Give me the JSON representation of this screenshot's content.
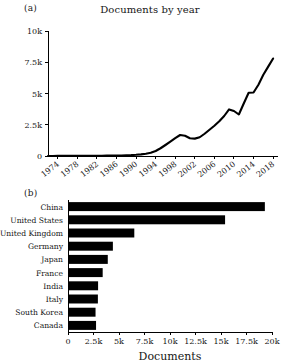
{
  "figure": {
    "panel_a_letter": "(a)",
    "panel_b_letter": "(b)"
  },
  "chart_data": [
    {
      "type": "line",
      "panel": "(a)",
      "title": "Documents by year",
      "xlabel": "",
      "ylabel": "",
      "xlim": [
        1972,
        2019
      ],
      "ylim": [
        0,
        10000
      ],
      "grid": false,
      "legend": null,
      "xticks": [
        1974,
        1978,
        1982,
        1986,
        1990,
        1994,
        1998,
        2002,
        2006,
        2010,
        2014,
        2018
      ],
      "xticklabels": [
        "1974",
        "1978",
        "1982",
        "1986",
        "1990",
        "1994",
        "1998",
        "2002",
        "2006",
        "2010",
        "2014",
        "2018"
      ],
      "yticks": [
        0,
        2500,
        5000,
        7500,
        10000
      ],
      "yticklabels": [
        "0",
        "2.5k",
        "5k",
        "7.5k",
        "10k"
      ],
      "x": [
        1972,
        1973,
        1974,
        1975,
        1976,
        1977,
        1978,
        1979,
        1980,
        1981,
        1982,
        1983,
        1984,
        1985,
        1986,
        1987,
        1988,
        1989,
        1990,
        1991,
        1992,
        1993,
        1994,
        1995,
        1996,
        1997,
        1998,
        1999,
        2000,
        2001,
        2002,
        2003,
        2004,
        2005,
        2006,
        2007,
        2008,
        2009,
        2010,
        2011,
        2012,
        2013,
        2014,
        2015,
        2016,
        2017,
        2018
      ],
      "y": [
        5,
        6,
        8,
        8,
        10,
        12,
        14,
        15,
        18,
        20,
        22,
        25,
        28,
        32,
        38,
        45,
        55,
        70,
        95,
        130,
        180,
        260,
        400,
        620,
        880,
        1150,
        1430,
        1680,
        1620,
        1420,
        1390,
        1500,
        1780,
        2100,
        2420,
        2780,
        3200,
        3730,
        3600,
        3320,
        4200,
        5060,
        5080,
        5700,
        6500,
        7150,
        7800
      ]
    },
    {
      "type": "bar",
      "orientation": "horizontal",
      "panel": "(b)",
      "title": "",
      "xlabel": "Documents",
      "ylabel": "",
      "xlim": [
        0,
        20000
      ],
      "grid": false,
      "legend": null,
      "xticks": [
        0,
        2500,
        5000,
        7500,
        10000,
        12500,
        15000,
        17500,
        20000
      ],
      "xticklabels": [
        "0",
        "2.5k",
        "5k",
        "7.5k",
        "10k",
        "12.5k",
        "15k",
        "17.5k",
        "20k"
      ],
      "categories": [
        "China",
        "United States",
        "United Kingdom",
        "Germany",
        "Japan",
        "France",
        "India",
        "Italy",
        "South Korea",
        "Canada"
      ],
      "values": [
        19300,
        15400,
        6500,
        4400,
        3900,
        3400,
        2950,
        2930,
        2700,
        2750
      ]
    }
  ]
}
